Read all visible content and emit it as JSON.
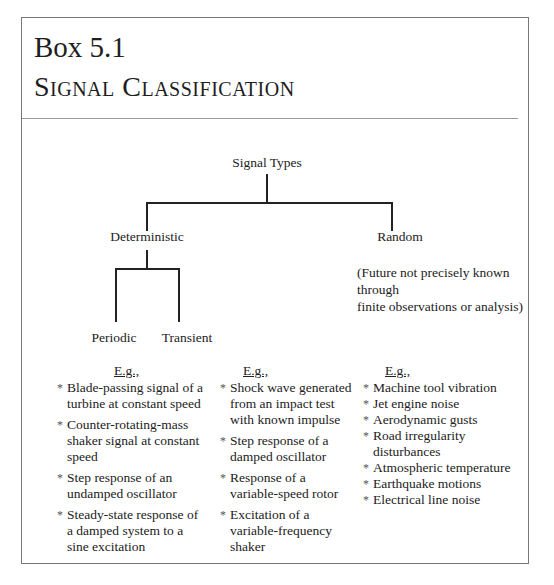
{
  "header": {
    "box_number": "Box 5.1",
    "box_title": "Signal Classification"
  },
  "tree": {
    "root": "Signal Types",
    "level1": [
      "Deterministic",
      "Random"
    ],
    "deterministic_children": [
      "Periodic",
      "Transient"
    ],
    "random_note": [
      "(Future not precisely known through",
      "finite observations or analysis)"
    ]
  },
  "examples": {
    "label": "E.g.,",
    "periodic": [
      "Blade-passing signal of a turbine at constant speed",
      "Counter-rotating-mass shaker signal at constant speed",
      "Step response of an undamped oscillator",
      "Steady-state response of a damped system to a sine excitation"
    ],
    "transient": [
      "Shock wave generated from an impact test with known impulse",
      "Step response of a damped oscillator",
      "Response of a variable-speed rotor",
      "Excitation of a variable-frequency shaker"
    ],
    "random": [
      "Machine tool vibration",
      "Jet engine noise",
      "Aerodynamic gusts",
      "Road irregularity disturbances",
      "Atmospheric temperature",
      "Earthquake motions",
      "Electrical line noise"
    ]
  }
}
